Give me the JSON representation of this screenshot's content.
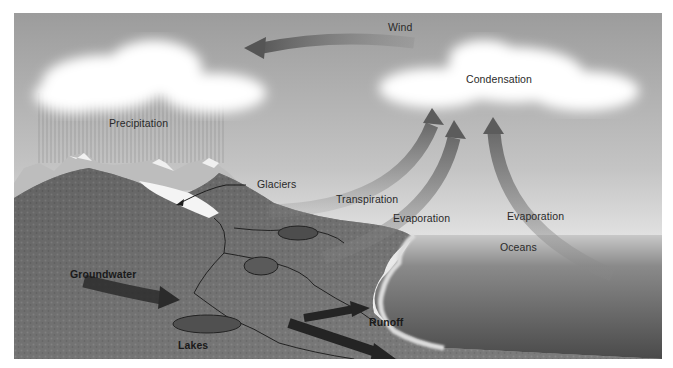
{
  "diagram": {
    "palette": {
      "sky_top": "#9a9a9a",
      "sky_bottom": "#e6e6e6",
      "cloud": "#ffffff",
      "arrow": "#6e6e6e",
      "land": "#6f6f6f",
      "ocean": "#5a5a5a",
      "text": "#2a2a2a"
    },
    "labels": {
      "wind": "Wind",
      "condensation": "Condensation",
      "precipitation": "Precipitation",
      "glaciers": "Glaciers",
      "transpiration": "Transpiration",
      "evaporation_land": "Evaporation",
      "evaporation_ocean": "Evaporation",
      "oceans": "Oceans",
      "groundwater": "Groundwater",
      "runoff": "Runoff",
      "lakes": "Lakes"
    },
    "icons": [
      "wind-arrow-icon",
      "transpiration-arrow-icon",
      "evaporation-arrow-icon",
      "ocean-evaporation-arrow-icon",
      "groundwater-arrow-icon",
      "runoff-arrow-icon",
      "glacier-pointer-icon"
    ]
  }
}
